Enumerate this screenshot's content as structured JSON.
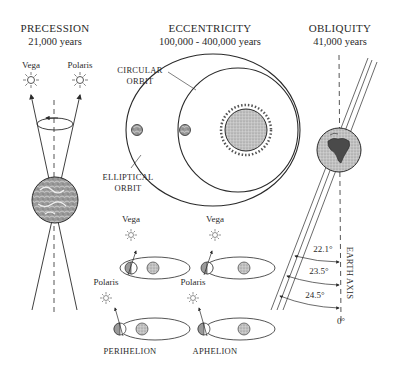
{
  "precession": {
    "title": "PRECESSION",
    "period": "21,000 years",
    "stars": [
      "Vega",
      "Polaris"
    ]
  },
  "eccentricity": {
    "title": "ECCENTRICITY",
    "period": "100,000 - 400,000 years",
    "labels": {
      "circular_l1": "CIRCULAR",
      "circular_l2": "ORBIT",
      "elliptical_l1": "ELLIPTICAL",
      "elliptical_l2": "ORBIT"
    },
    "mini": {
      "vega_left": "Vega",
      "vega_right": "Vega",
      "polaris_left": "Polaris",
      "polaris_right": "Polaris",
      "perihelion": "PERIHELION",
      "aphelion": "APHELION"
    }
  },
  "obliquity": {
    "title": "OBLIQUITY",
    "period": "41,000 years",
    "angles": [
      "22.1°",
      "23.5°",
      "24.5°"
    ],
    "zero": "0°",
    "axis_label": "EARTH AXIS"
  },
  "colors": {
    "ink": "#2a2a2a",
    "sun_fill": "#b8b8b8",
    "background": "#ffffff"
  }
}
